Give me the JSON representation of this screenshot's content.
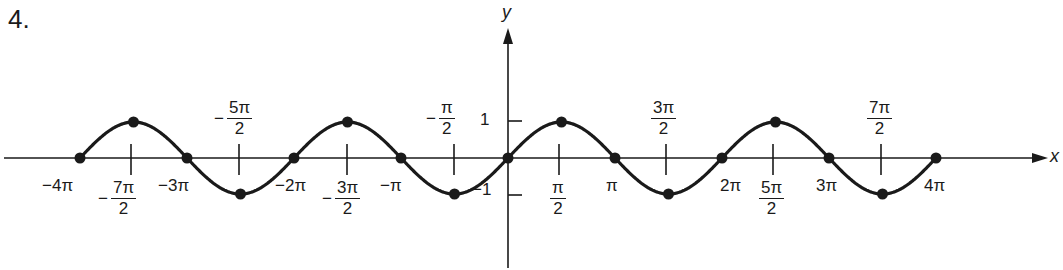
{
  "problem_number": "4.",
  "chart_data": {
    "type": "line",
    "title": "",
    "function": "y = sin x",
    "xlabel": "x",
    "ylabel": "y",
    "xlim": [
      -12.566,
      12.566
    ],
    "ylim": [
      -1,
      1
    ],
    "grid": false,
    "legend": null,
    "y_ticks": [
      {
        "value": 1,
        "label": "1"
      },
      {
        "value": -1,
        "label": "-1"
      }
    ],
    "x_ticks_below": [
      "-4π",
      "-7π/2",
      "-3π",
      "-2π",
      "-3π/2",
      "-π",
      "π/2",
      "π",
      "2π",
      "5π/2",
      "3π",
      "4π"
    ],
    "x_ticks_above": [
      "-5π/2",
      "-π/2",
      "3π/2",
      "7π/2"
    ],
    "points": [
      {
        "x": "-4π",
        "y": 0
      },
      {
        "x": "-7π/2",
        "y": 1
      },
      {
        "x": "-3π",
        "y": 0
      },
      {
        "x": "-5π/2",
        "y": -1
      },
      {
        "x": "-2π",
        "y": 0
      },
      {
        "x": "-3π/2",
        "y": 1
      },
      {
        "x": "-π",
        "y": 0
      },
      {
        "x": "-π/2",
        "y": -1
      },
      {
        "x": "0",
        "y": 0
      },
      {
        "x": "π/2",
        "y": 1
      },
      {
        "x": "π",
        "y": 0
      },
      {
        "x": "3π/2",
        "y": -1
      },
      {
        "x": "2π",
        "y": 0
      },
      {
        "x": "5π/2",
        "y": 1
      },
      {
        "x": "3π",
        "y": 0
      },
      {
        "x": "7π/2",
        "y": -1
      },
      {
        "x": "4π",
        "y": 0
      }
    ]
  },
  "labels": {
    "x_axis": "x",
    "y_axis": "y",
    "y_one": "1",
    "y_neg_one": "−1",
    "neg4pi": "−4π",
    "neg3pi": "−3π",
    "neg2pi": "−2π",
    "negpi": "−π",
    "pi": "π",
    "twopi": "2π",
    "threepi": "3π",
    "fourpi": "4π",
    "minus": "−",
    "two": "2",
    "seven_pi": "7π",
    "five_pi": "5π",
    "three_pi": "3π",
    "pi_sym": "π"
  }
}
